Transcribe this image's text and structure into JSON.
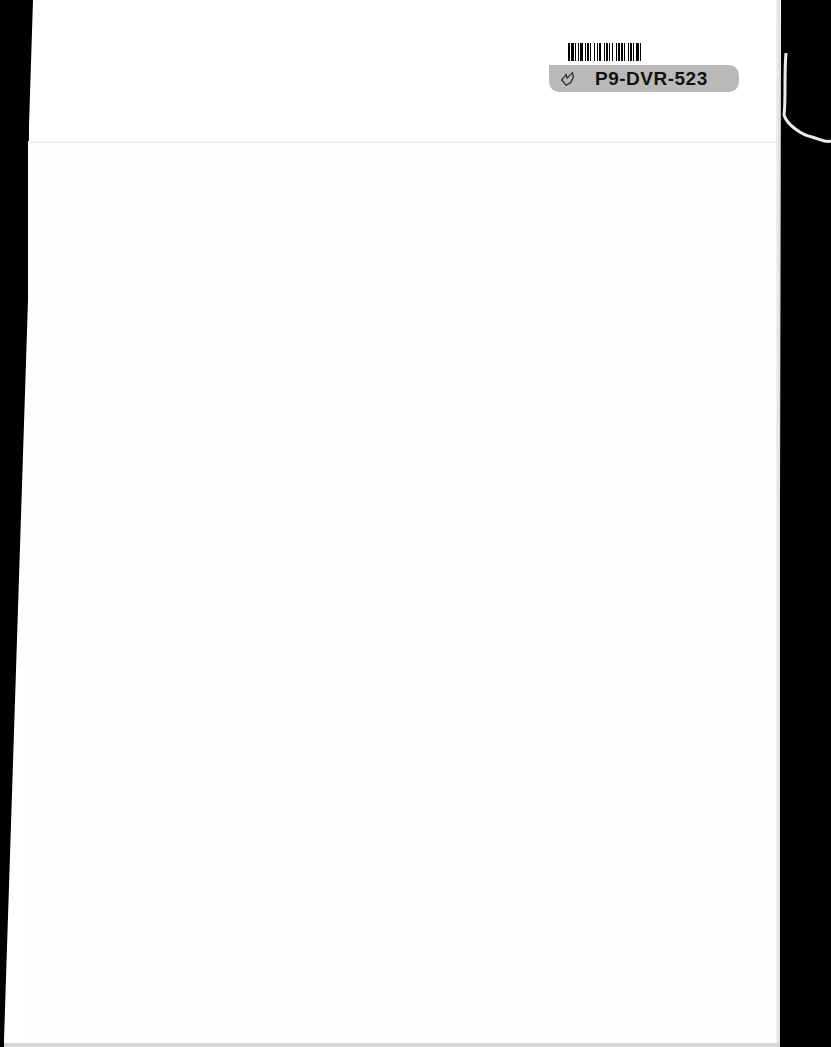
{
  "scan": {
    "description": "Scanned blank book page with library barcode sticker",
    "background_color": "#000000",
    "page_color": "#ffffff"
  },
  "barcode_label": {
    "code": "P9-DVR-523",
    "icon": "hand-icon",
    "band_color": "#b9b9b9"
  }
}
